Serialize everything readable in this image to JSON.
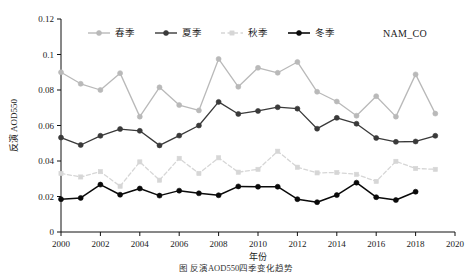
{
  "figure": {
    "panel_label": "NAM_CO",
    "caption": "图  反演AOD550四季变化趋势",
    "background_color": "#ffffff"
  },
  "axes": {
    "x_title": "年份",
    "y_title": "反演 AOD550",
    "x_ticks": [
      "2000",
      "2002",
      "2004",
      "2006",
      "2008",
      "2010",
      "2012",
      "2014",
      "2016",
      "2018",
      "2020"
    ],
    "y_ticks": [
      "0",
      "0.02",
      "0.04",
      "0.06",
      "0.08",
      "0.1",
      "0.12"
    ],
    "xlim": [
      2000,
      2020
    ],
    "ylim": [
      0,
      0.12
    ],
    "grid": false
  },
  "legend": {
    "position": "top-center-inside",
    "entries": [
      {
        "label": "春季",
        "color": "#b9b9b9",
        "marker": "circle",
        "dash": "solid"
      },
      {
        "label": "夏季",
        "color": "#3a3a3a",
        "marker": "circle",
        "dash": "solid"
      },
      {
        "label": "秋季",
        "color": "#d6d6d6",
        "marker": "square",
        "dash": "dashed"
      },
      {
        "label": "冬季",
        "color": "#0a0a0a",
        "marker": "circle",
        "dash": "solid"
      }
    ]
  },
  "chart_data": {
    "type": "line",
    "title": "",
    "subtitle": "",
    "xlabel": "年份",
    "ylabel": "反演 AOD550",
    "xlim": [
      2000,
      2020
    ],
    "ylim": [
      0,
      0.12
    ],
    "grid": false,
    "legend_position": "top-center-inside",
    "annotations": [
      "NAM_CO"
    ],
    "x": [
      2000,
      2001,
      2002,
      2003,
      2004,
      2005,
      2006,
      2007,
      2008,
      2009,
      2010,
      2011,
      2012,
      2013,
      2014,
      2015,
      2016,
      2017,
      2018,
      2019
    ],
    "series": [
      {
        "name": "春季",
        "color": "#b9b9b9",
        "marker": "circle",
        "dash": "solid",
        "values": [
          0.09,
          0.0835,
          0.08,
          0.0895,
          0.065,
          0.0815,
          0.0715,
          0.0685,
          0.0975,
          0.0818,
          0.0925,
          0.0897,
          0.0958,
          0.079,
          0.0735,
          0.0655,
          0.0765,
          0.065,
          0.0888,
          0.0667
        ]
      },
      {
        "name": "夏季",
        "color": "#3a3a3a",
        "marker": "circle",
        "dash": "solid",
        "values": [
          0.0532,
          0.049,
          0.0542,
          0.058,
          0.057,
          0.0488,
          0.0543,
          0.06,
          0.0733,
          0.0665,
          0.0682,
          0.0703,
          0.0695,
          0.0582,
          0.0643,
          0.061,
          0.053,
          0.0508,
          0.051,
          0.0542
        ]
      },
      {
        "name": "秋季",
        "color": "#d6d6d6",
        "marker": "square",
        "dash": "dashed",
        "values": [
          0.033,
          0.031,
          0.034,
          0.0258,
          0.0395,
          0.0292,
          0.0415,
          0.033,
          0.0418,
          0.0337,
          0.0353,
          0.0455,
          0.0365,
          0.0333,
          0.0335,
          0.0325,
          0.0285,
          0.0398,
          0.0358,
          0.0353
        ]
      },
      {
        "name": "冬季",
        "color": "#0a0a0a",
        "marker": "circle",
        "dash": "solid",
        "values": [
          0.0185,
          0.0192,
          0.0267,
          0.021,
          0.0245,
          0.0205,
          0.0233,
          0.0218,
          0.0207,
          0.0257,
          0.0255,
          0.0255,
          0.0185,
          0.0168,
          0.0208,
          0.0278,
          0.0196,
          0.018,
          0.0227,
          null
        ]
      }
    ]
  }
}
